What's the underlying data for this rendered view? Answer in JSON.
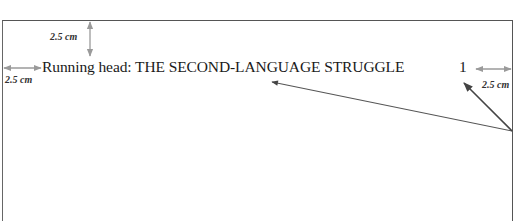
{
  "document": {
    "running_head": "Running head: THE SECOND-LANGUAGE STRUGGLE",
    "page_number": "1"
  },
  "annotations": {
    "top_margin_label": "2.5 cm",
    "left_margin_label": "2.5 cm",
    "right_margin_label": "2.5 cm"
  },
  "colors": {
    "margin_arrow": "#9a9a9a",
    "pointer_arrow": "#444444",
    "page_border": "#555555",
    "text": "#1a1a1a"
  }
}
